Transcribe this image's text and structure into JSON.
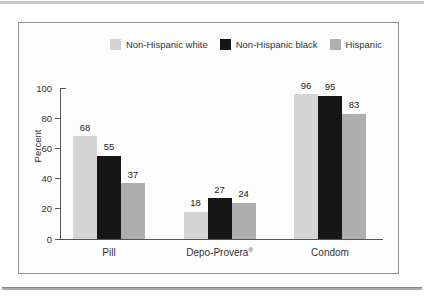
{
  "figure": {
    "frame_border_color": "#8f8f8f",
    "frame_background": "#fdfdfd",
    "top_rule_color": "#c7c7c7",
    "bottom_rule_color": "#aaaaaa"
  },
  "chart_data": {
    "type": "bar",
    "title": "",
    "xlabel": "",
    "ylabel": "Percent",
    "ylim": [
      0,
      100
    ],
    "yticks": [
      0,
      20,
      40,
      60,
      80,
      100
    ],
    "grid": false,
    "legend_position": "top-right",
    "bar_value_labels": true,
    "categories": [
      {
        "label": "Pill",
        "sup": ""
      },
      {
        "label": "Depo-Provera",
        "sup": "®"
      },
      {
        "label": "Condom",
        "sup": ""
      }
    ],
    "series": [
      {
        "name": "Non-Hispanic white",
        "color": "#d4d4d4",
        "values": [
          68,
          18,
          96
        ]
      },
      {
        "name": "Non-Hispanic black",
        "color": "#161616",
        "values": [
          55,
          27,
          95
        ]
      },
      {
        "name": "Hispanic",
        "color": "#aeaeae",
        "values": [
          37,
          24,
          83
        ]
      }
    ]
  }
}
